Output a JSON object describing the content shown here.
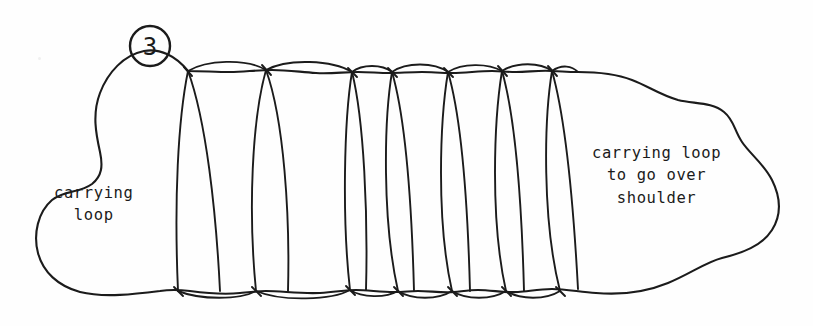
{
  "figure": {
    "badge_number": "3",
    "ink_color": "#1b1b1b",
    "background_color": "#fefefe",
    "style": "hand-drawn pen sketch",
    "coil_count": 8
  },
  "labels": {
    "left_loop": "carrying\nloop",
    "right_loop": "carrying loop\nto go over\nshoulder"
  }
}
